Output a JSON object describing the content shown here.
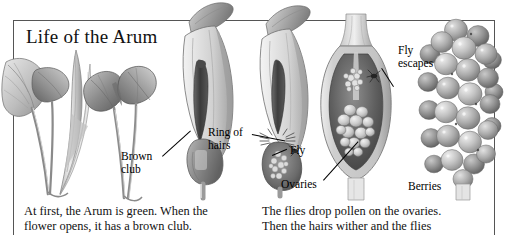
{
  "figure": {
    "title": "Life of the Arum"
  },
  "labels": {
    "brown_club_line1": "Brown",
    "brown_club_line2": "club",
    "ring_of_hairs_line1": "Ring of",
    "ring_of_hairs_line2": "hairs",
    "fly": "Fly",
    "fly_escapes_line1": "Fly",
    "fly_escapes_line2": "escapes",
    "ovaries": "Ovaries",
    "berries": "Berries"
  },
  "captions": {
    "left_line1": "At first, the Arum is green. When the",
    "left_line2": "flower opens, it has a brown club.",
    "right_line1": "The flies drop pollen on the ovaries.",
    "right_line2": "Then the hairs wither and the flies"
  },
  "colors": {
    "frame": "#555555",
    "text": "#111111",
    "leader": "#000000",
    "plant_light": "#d8d8d8",
    "plant_mid": "#a9a9a9",
    "plant_dark": "#6e6e6e",
    "spadix": "#3c3c3c",
    "chamber_dark": "#555555",
    "berry_light": "#cfcfcf",
    "berry_mid": "#9e9e9e"
  }
}
